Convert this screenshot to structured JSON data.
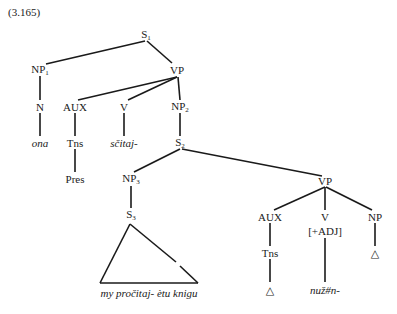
{
  "example_number": "(3.165)",
  "nodes": {
    "s1": {
      "label": "S",
      "sub": "1"
    },
    "np1": {
      "label": "NP",
      "sub": "1"
    },
    "vp_top": {
      "label": "VP"
    },
    "n": {
      "label": "N"
    },
    "ona": {
      "label": "ona"
    },
    "aux1": {
      "label": "AUX"
    },
    "tns1": {
      "label": "Tns"
    },
    "pres": {
      "label": "Pres"
    },
    "v1": {
      "label": "V"
    },
    "scitaj": {
      "label": "sčitaj-"
    },
    "np2": {
      "label": "NP",
      "sub": "2"
    },
    "s2": {
      "label": "S",
      "sub": "2"
    },
    "np3": {
      "label": "NP",
      "sub": "3"
    },
    "s3": {
      "label": "S",
      "sub": "3"
    },
    "vp2": {
      "label": "VP"
    },
    "aux2": {
      "label": "AUX"
    },
    "tns2": {
      "label": "Tns"
    },
    "delta1": {
      "label": "△"
    },
    "v2": {
      "label": "V"
    },
    "adj_feature": {
      "label": "[+ADJ]"
    },
    "nuzn": {
      "label": "nuž#n-"
    },
    "np4": {
      "label": "NP"
    },
    "delta2": {
      "label": "△"
    },
    "triangle_text": {
      "label": "my pročitaj- ètu knigu"
    }
  }
}
